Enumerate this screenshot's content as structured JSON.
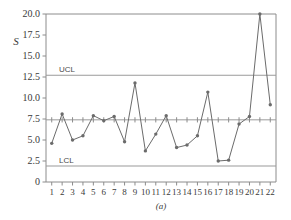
{
  "figure": {
    "caption": "(a)",
    "y_axis_name": "S"
  },
  "chart_data": {
    "type": "line",
    "title": "",
    "xlabel": "",
    "ylabel": "S",
    "x": [
      1,
      2,
      3,
      4,
      5,
      6,
      7,
      8,
      9,
      10,
      11,
      12,
      13,
      14,
      15,
      16,
      17,
      18,
      19,
      20,
      21,
      22
    ],
    "xtick_labels": [
      "1",
      "2",
      "3",
      "4",
      "5",
      "6",
      "7",
      "8",
      "9",
      "10",
      "11",
      "12",
      "13",
      "14",
      "15",
      "16",
      "17",
      "18",
      "19",
      "20",
      "21",
      "22"
    ],
    "values": [
      4.6,
      8.1,
      5.0,
      5.5,
      7.9,
      7.3,
      7.8,
      4.8,
      11.8,
      3.7,
      5.7,
      7.9,
      4.1,
      4.4,
      5.5,
      10.7,
      2.5,
      2.6,
      6.9,
      7.8,
      20.0,
      9.2
    ],
    "ylim": [
      0,
      20.0
    ],
    "xlim": [
      0.45,
      22.55
    ],
    "ytick_values": [
      0,
      2.5,
      5.0,
      7.5,
      10.0,
      12.5,
      15.0,
      17.5,
      20.0
    ],
    "ytick_labels": [
      "0",
      "2.5",
      "5.0",
      "7.5",
      "10.0",
      "12.5",
      "15.0",
      "17.5",
      "20.0"
    ],
    "grid": false,
    "legend": "none",
    "control_limits": {
      "ucl": {
        "label": "UCL",
        "value": 12.7
      },
      "center": {
        "label": "",
        "value": 7.4
      },
      "lcl": {
        "label": "LCL",
        "value": 1.9
      }
    },
    "marker": "circle",
    "line_color": "#6b6b6b",
    "limit_color": "#9a9a9a"
  }
}
